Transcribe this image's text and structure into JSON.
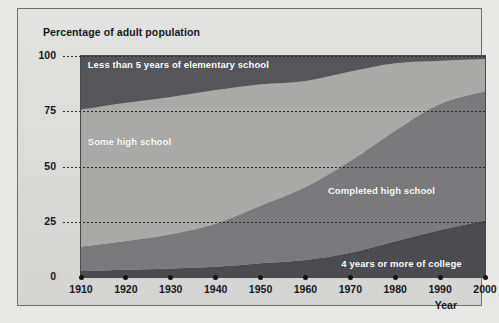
{
  "figure": {
    "title": "Percentage of adult population",
    "x_axis_title": "Year"
  },
  "chart_data": {
    "type": "area",
    "title": "Percentage of adult population",
    "subtitle": "",
    "xlabel": "Year",
    "ylabel": "Percentage of adult population",
    "stacked": true,
    "stack_total": 100,
    "grid": "horizontal-dotted",
    "legend": "inline-labels",
    "xlim": [
      1910,
      2000
    ],
    "ylim": [
      0,
      100
    ],
    "x": [
      1910,
      1920,
      1930,
      1940,
      1950,
      1960,
      1970,
      1980,
      1990,
      2000
    ],
    "xticks": [
      "1910",
      "1920",
      "1930",
      "1940",
      "1950",
      "1960",
      "1970",
      "1980",
      "1990",
      "2000"
    ],
    "yticks": [
      "0",
      "25",
      "50",
      "75",
      "100"
    ],
    "series": [
      {
        "name": "4 years or more of college",
        "order": 1,
        "color": "#4c4c50",
        "values": [
          2.7,
          3.3,
          3.9,
          4.6,
          6.2,
          7.7,
          11.0,
          16.2,
          21.3,
          25.6
        ]
      },
      {
        "name": "Completed high school",
        "order": 2,
        "color": "#7a7a7c",
        "values": [
          11.0,
          13.0,
          15.5,
          19.5,
          26.0,
          33.0,
          41.5,
          50.0,
          57.0,
          58.5
        ]
      },
      {
        "name": "Some high school",
        "order": 3,
        "color": "#a9a9a7",
        "values": [
          62.0,
          62.5,
          62.0,
          60.5,
          55.0,
          48.0,
          40.5,
          30.5,
          19.5,
          14.5
        ]
      },
      {
        "name": "Less than 5 years of elementary school",
        "order": 4,
        "color": "#55555a",
        "values": [
          24.3,
          21.2,
          18.6,
          15.4,
          12.8,
          11.3,
          7.0,
          3.3,
          2.2,
          1.4
        ]
      }
    ],
    "annotations": [
      {
        "text": "Less than 5 years of elementary school",
        "x": 1911.5,
        "y": 96
      },
      {
        "text": "Some high school",
        "x": 1911.5,
        "y": 61
      },
      {
        "text": "Completed high school",
        "x": 1965.0,
        "y": 39
      },
      {
        "text": "4 years or more of college",
        "x": 1968.0,
        "y": 6
      }
    ]
  }
}
